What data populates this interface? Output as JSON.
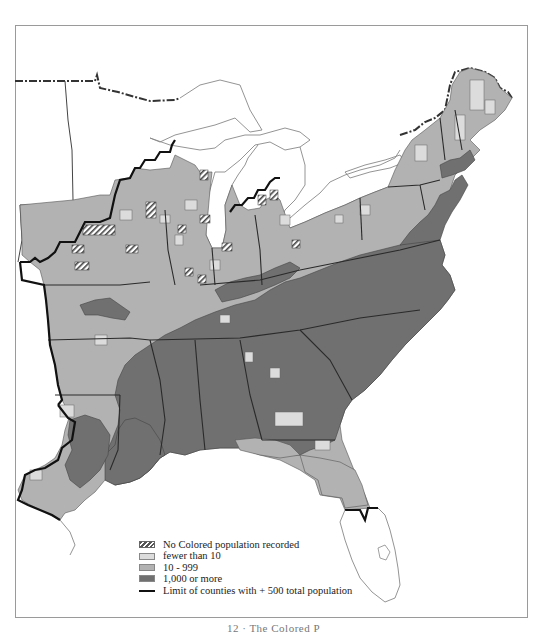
{
  "colors": {
    "few": "#dcdcdc",
    "mid": "#b2b2b2",
    "many": "#707070",
    "county_line": "#555555",
    "state_line": "#2a2a2a",
    "limit_line": "#111111",
    "coast": "#888888"
  },
  "legend": {
    "items": [
      {
        "key": "none",
        "label": "No Colored population recorded"
      },
      {
        "key": "few",
        "label": "fewer than 10"
      },
      {
        "key": "mid",
        "label": "10 - 999"
      },
      {
        "key": "many",
        "label": "1,000 or more"
      },
      {
        "key": "limit",
        "label": "Limit of counties with + 500 total population"
      }
    ]
  },
  "caption": "12 · The Colored P"
}
